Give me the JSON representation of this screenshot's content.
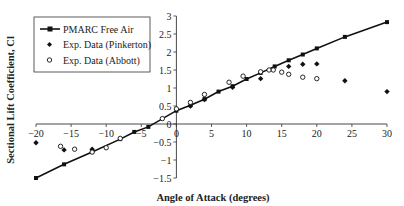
{
  "chart_data": {
    "type": "line",
    "title": "",
    "xlabel": "Angle of Attack (degrees)",
    "ylabel": "Sectional Lift Coefficient, Cl",
    "xlim": [
      -20,
      30
    ],
    "ylim": [
      -1.5,
      3
    ],
    "x_ticks": [
      -20,
      -15,
      -10,
      -5,
      0,
      5,
      10,
      15,
      20,
      25,
      30
    ],
    "y_ticks": [
      -1.5,
      -1,
      -0.5,
      0,
      0.5,
      1,
      1.5,
      2,
      2.5,
      3
    ],
    "x_tick_labels": [
      "-20",
      "-15",
      "-10",
      "-5",
      "0",
      "5",
      "10",
      "15",
      "20",
      "25",
      "30"
    ],
    "y_tick_labels": [
      "-1.5",
      "-1",
      "-0.5",
      "0",
      "0.5",
      "1",
      "1.5",
      "2",
      "2.5",
      "3"
    ],
    "grid": false,
    "legend_position": "upper-left",
    "series": [
      {
        "name": "PMARC Free Air",
        "style": "line-with-square-markers",
        "color": "#111111",
        "x": [
          -20,
          -16,
          -12,
          -8,
          -6,
          -4,
          0,
          2,
          4,
          6,
          8,
          10,
          12,
          14,
          16,
          18,
          20,
          24,
          30
        ],
        "y": [
          -1.5,
          -1.12,
          -0.78,
          -0.42,
          -0.22,
          -0.08,
          0.37,
          0.52,
          0.69,
          0.9,
          1.05,
          1.25,
          1.42,
          1.6,
          1.77,
          1.93,
          2.1,
          2.42,
          2.83
        ]
      },
      {
        "name": "Exp. Data (Pinkerton)",
        "style": "diamond-markers",
        "color": "#111111",
        "x": [
          -20,
          -16,
          -12,
          2,
          4,
          8,
          12,
          16,
          18,
          20,
          24,
          30
        ],
        "y": [
          -0.52,
          -0.72,
          -0.7,
          0.5,
          0.68,
          1.02,
          1.26,
          1.6,
          1.66,
          1.67,
          1.2,
          0.9
        ]
      },
      {
        "name": "Exp. Data (Abbott)",
        "style": "open-circle-markers",
        "color": "#111111",
        "x": [
          -16.5,
          -14.5,
          -12,
          -10,
          -8,
          -2,
          0,
          2,
          4,
          7.5,
          9.5,
          12,
          13.2,
          13.8,
          15,
          16,
          18,
          20
        ],
        "y": [
          -0.62,
          -0.7,
          -0.78,
          -0.66,
          -0.4,
          0.15,
          0.42,
          0.6,
          0.82,
          1.16,
          1.33,
          1.45,
          1.5,
          1.5,
          1.44,
          1.38,
          1.3,
          1.26
        ]
      }
    ]
  },
  "legend": {
    "items": [
      {
        "label": "PMARC Free Air"
      },
      {
        "label": "Exp. Data (Pinkerton)"
      },
      {
        "label": "Exp. Data (Abbott)"
      }
    ]
  },
  "axes": {
    "x_title": "Angle of Attack (degrees)",
    "y_title": "Sectional Lift Coefficient, Cl"
  }
}
